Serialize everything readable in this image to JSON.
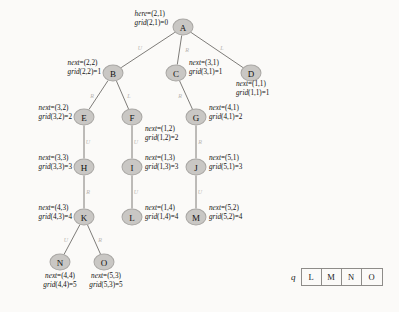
{
  "diagram": {
    "node_fill": "#c9c7c4",
    "node_stroke": "#a9a7a4",
    "edge_color": "#6f6d6a",
    "background": "#fbfaf8",
    "nodes": [
      {
        "id": "A",
        "label": "A",
        "x": 183,
        "y": 27
      },
      {
        "id": "B",
        "label": "B",
        "x": 113,
        "y": 73
      },
      {
        "id": "C",
        "label": "C",
        "x": 176,
        "y": 73
      },
      {
        "id": "D",
        "label": "D",
        "x": 251,
        "y": 73
      },
      {
        "id": "E",
        "label": "E",
        "x": 84,
        "y": 117
      },
      {
        "id": "F",
        "label": "F",
        "x": 132,
        "y": 117
      },
      {
        "id": "G",
        "label": "G",
        "x": 196,
        "y": 117
      },
      {
        "id": "H",
        "label": "H",
        "x": 84,
        "y": 167
      },
      {
        "id": "I",
        "label": "I",
        "x": 132,
        "y": 167
      },
      {
        "id": "J",
        "label": "J",
        "x": 196,
        "y": 167
      },
      {
        "id": "K",
        "label": "K",
        "x": 84,
        "y": 217
      },
      {
        "id": "L",
        "label": "L",
        "x": 132,
        "y": 217
      },
      {
        "id": "M",
        "label": "M",
        "x": 196,
        "y": 217
      },
      {
        "id": "N",
        "label": "N",
        "x": 60,
        "y": 262
      },
      {
        "id": "O",
        "label": "O",
        "x": 104,
        "y": 262
      }
    ],
    "edges": [
      {
        "from": "A",
        "to": "B",
        "label": "U",
        "lx": 140,
        "ly": 48
      },
      {
        "from": "A",
        "to": "C",
        "label": "R",
        "lx": 187,
        "ly": 50
      },
      {
        "from": "A",
        "to": "D",
        "label": "L",
        "lx": 222,
        "ly": 48
      },
      {
        "from": "B",
        "to": "E",
        "label": "R",
        "lx": 92,
        "ly": 96
      },
      {
        "from": "B",
        "to": "F",
        "label": "L",
        "lx": 129,
        "ly": 96
      },
      {
        "from": "C",
        "to": "G",
        "label": "R",
        "lx": 180,
        "ly": 96
      },
      {
        "from": "E",
        "to": "H",
        "label": "U",
        "lx": 88,
        "ly": 142
      },
      {
        "from": "F",
        "to": "I",
        "label": "U",
        "lx": 136,
        "ly": 142
      },
      {
        "from": "G",
        "to": "J",
        "label": "R",
        "lx": 200,
        "ly": 142
      },
      {
        "from": "H",
        "to": "K",
        "label": "R",
        "lx": 88,
        "ly": 192
      },
      {
        "from": "I",
        "to": "L",
        "label": "U",
        "lx": 136,
        "ly": 192
      },
      {
        "from": "J",
        "to": "M",
        "label": "U",
        "lx": 200,
        "ly": 192
      },
      {
        "from": "K",
        "to": "N",
        "label": "U",
        "lx": 66,
        "ly": 240
      },
      {
        "from": "K",
        "to": "O",
        "label": "R",
        "lx": 100,
        "ly": 240
      }
    ],
    "annotations": [
      {
        "node": "A",
        "side": "left",
        "x": 168,
        "y": 19,
        "line1": "here=(2,1)",
        "line2": "grid(2,1)=0"
      },
      {
        "node": "B",
        "side": "left",
        "x": 101,
        "y": 68,
        "line1": "next=(2,2)",
        "line2": "grid(2,2)=1"
      },
      {
        "node": "C",
        "side": "right",
        "x": 189,
        "y": 68,
        "line1": "next=(3,1)",
        "line2": "grid(3,1)=1"
      },
      {
        "node": "D",
        "side": "right",
        "x": 236,
        "y": 89,
        "line1": "next=(1,1)",
        "line2": "grid(1,1)=1"
      },
      {
        "node": "E",
        "side": "left",
        "x": 72,
        "y": 113,
        "line1": "next=(3,2)",
        "line2": "grid(3,2)=2"
      },
      {
        "node": "F",
        "side": "right",
        "x": 145,
        "y": 134,
        "line1": "next=(1,2)",
        "line2": "grid(1,2)=2"
      },
      {
        "node": "G",
        "side": "right",
        "x": 209,
        "y": 113,
        "line1": "next=(4,1)",
        "line2": "grid(4,1)=2"
      },
      {
        "node": "H",
        "side": "left",
        "x": 72,
        "y": 163,
        "line1": "next=(3,3)",
        "line2": "grid(3,3)=3"
      },
      {
        "node": "I",
        "side": "right",
        "x": 145,
        "y": 163,
        "line1": "next=(1,3)",
        "line2": "grid(1,3)=3"
      },
      {
        "node": "J",
        "side": "right",
        "x": 209,
        "y": 163,
        "line1": "next=(5,1)",
        "line2": "grid(5,1)=3"
      },
      {
        "node": "K",
        "side": "left",
        "x": 72,
        "y": 213,
        "line1": "next=(4,3)",
        "line2": "grid(4,3)=4"
      },
      {
        "node": "L",
        "side": "right",
        "x": 145,
        "y": 213,
        "line1": "next=(1,4)",
        "line2": "grid(1,4)=4"
      },
      {
        "node": "M",
        "side": "right",
        "x": 209,
        "y": 213,
        "line1": "next=(5,2)",
        "line2": "grid(5,2)=4"
      },
      {
        "node": "N",
        "side": "below",
        "x": 60,
        "y": 272,
        "line1": "next=(4,4)",
        "line2": "grid(4,4)=5"
      },
      {
        "node": "O",
        "side": "below",
        "x": 106,
        "y": 272,
        "line1": "next=(5,3)",
        "line2": "grid(5,3)=5"
      }
    ]
  },
  "queue": {
    "label": "q",
    "cells": [
      "L",
      "M",
      "N",
      "O"
    ]
  }
}
